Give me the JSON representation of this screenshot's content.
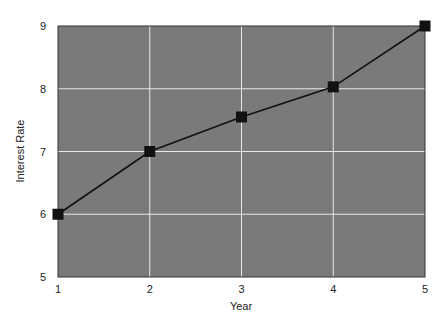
{
  "chart_data": {
    "type": "line",
    "title": "",
    "xlabel": "Year",
    "ylabel": "Interest Rate",
    "x": [
      1,
      2,
      3,
      4,
      5
    ],
    "series": [
      {
        "name": "Interest Rate",
        "values": [
          6,
          7,
          7.55,
          8.03,
          9
        ]
      }
    ],
    "xlim": [
      1,
      5
    ],
    "ylim": [
      5,
      9
    ],
    "xticks": [
      "1",
      "2",
      "3",
      "4",
      "5"
    ],
    "yticks": [
      "5",
      "6",
      "7",
      "8",
      "9"
    ],
    "grid": true,
    "legend": null,
    "colors": {
      "plot_background": "#7a7a7a",
      "grid": "#e8e8e8",
      "line": "#111111",
      "marker": "#111111"
    },
    "marker": "square"
  }
}
